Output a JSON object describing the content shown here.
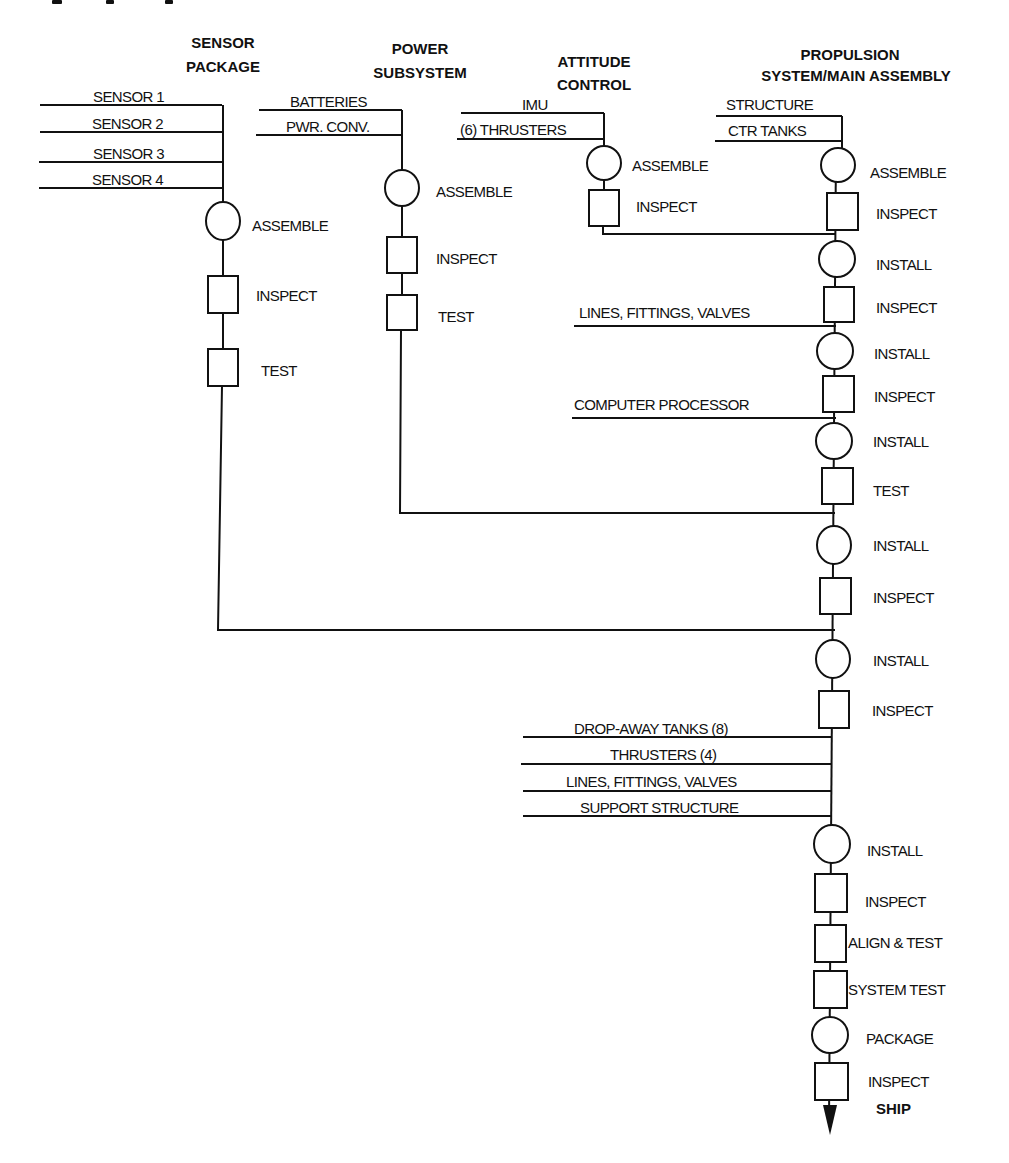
{
  "diagram": {
    "type": "assembly-flow-process-chart",
    "top_cut_caption": "",
    "columns": {
      "sensor": {
        "header_line1": "SENSOR",
        "header_line2": "PACKAGE",
        "inputs": [
          "SENSOR 1",
          "SENSOR 2",
          "SENSOR 3",
          "SENSOR 4"
        ],
        "steps": [
          {
            "shape": "circle",
            "label": "ASSEMBLE"
          },
          {
            "shape": "square",
            "label": "INSPECT"
          },
          {
            "shape": "square",
            "label": "TEST"
          }
        ]
      },
      "power": {
        "header_line1": "POWER",
        "header_line2": "SUBSYSTEM",
        "inputs": [
          "BATTERIES",
          "PWR. CONV."
        ],
        "steps": [
          {
            "shape": "circle",
            "label": "ASSEMBLE"
          },
          {
            "shape": "square",
            "label": "INSPECT"
          },
          {
            "shape": "square",
            "label": "TEST"
          }
        ]
      },
      "attitude": {
        "header_line1": "ATTITUDE",
        "header_line2": "CONTROL",
        "inputs": [
          "IMU",
          "(6) THRUSTERS"
        ],
        "steps": [
          {
            "shape": "circle",
            "label": "ASSEMBLE"
          },
          {
            "shape": "square",
            "label": "INSPECT"
          }
        ]
      },
      "main": {
        "header_line1": "PROPULSION",
        "header_line2": "SYSTEM/MAIN ASSEMBLY",
        "inputs": [
          "STRUCTURE",
          "CTR TANKS"
        ],
        "side_inputs": {
          "lines_fittings_valves": "LINES, FITTINGS, VALVES",
          "computer_processor": "COMPUTER PROCESSOR",
          "final_group": [
            "DROP-AWAY TANKS (8)",
            "THRUSTERS (4)",
            "LINES, FITTINGS, VALVES",
            "SUPPORT STRUCTURE"
          ]
        },
        "steps": [
          {
            "shape": "circle",
            "label": "ASSEMBLE"
          },
          {
            "shape": "square",
            "label": "INSPECT"
          },
          {
            "shape": "circle",
            "label": "INSTALL"
          },
          {
            "shape": "square",
            "label": "INSPECT"
          },
          {
            "shape": "circle",
            "label": "INSTALL"
          },
          {
            "shape": "square",
            "label": "INSPECT"
          },
          {
            "shape": "circle",
            "label": "INSTALL"
          },
          {
            "shape": "square",
            "label": "TEST"
          },
          {
            "shape": "circle",
            "label": "INSTALL"
          },
          {
            "shape": "square",
            "label": "INSPECT"
          },
          {
            "shape": "circle",
            "label": "INSTALL"
          },
          {
            "shape": "square",
            "label": "INSPECT"
          },
          {
            "shape": "circle",
            "label": "INSTALL"
          },
          {
            "shape": "square",
            "label": "INSPECT"
          },
          {
            "shape": "square",
            "label": "ALIGN & TEST"
          },
          {
            "shape": "square",
            "label": "SYSTEM TEST"
          },
          {
            "shape": "circle",
            "label": "PACKAGE"
          },
          {
            "shape": "square",
            "label": "INSPECT"
          }
        ],
        "end_label": "SHIP"
      }
    },
    "legend_semantics": {
      "circle": "operation (assemble/install/package)",
      "square": "inspection/test"
    },
    "colors": {
      "ink": "#111111",
      "paper": "#ffffff"
    }
  }
}
